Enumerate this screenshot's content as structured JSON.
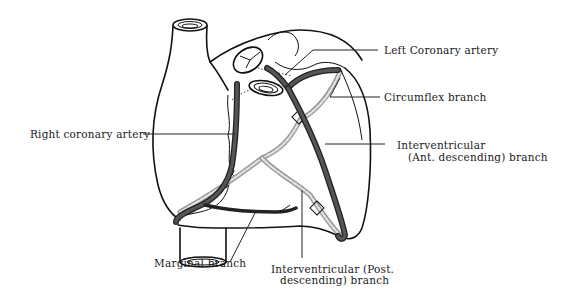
{
  "diagram": {
    "colors": {
      "background": "#ffffff",
      "outline": "#111111",
      "artery": "#333333",
      "vein": "#aaaaaa",
      "text": "#1a1a1a"
    },
    "labels": {
      "left_coronary": "Left Coronary artery",
      "circumflex": "Circumflex branch",
      "right_coronary": "Right coronary artery",
      "interventricular_ant_line1": "Interventricular",
      "interventricular_ant_line2": "(Ant. descending) branch",
      "marginal": "Marginal branch",
      "interventricular_post_line1": "Interventricular (Post.",
      "interventricular_post_line2": "descending) branch"
    }
  }
}
